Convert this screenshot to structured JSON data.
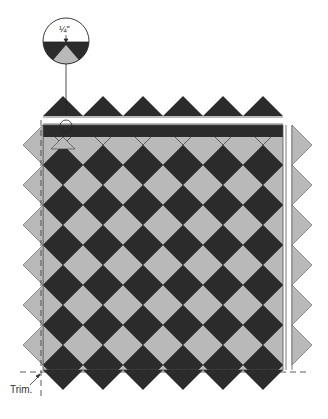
{
  "diagram": {
    "type": "quilt-assembly",
    "detail_callout": {
      "measurement": "¼\""
    },
    "trim_label": "Trim.",
    "colors": {
      "dark": "#2b2b2b",
      "light": "#b9b9b9",
      "outline": "#555555",
      "background": "#ffffff"
    }
  }
}
